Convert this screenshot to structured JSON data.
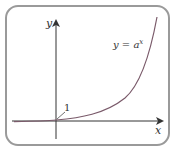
{
  "diagram": {
    "y_axis_label": "y",
    "x_axis_label": "x",
    "curve_label_base": "y = a",
    "curve_label_exp": "x",
    "intercept_label": "1",
    "colors": {
      "frame": "#9a9a9a",
      "axes": "#333333",
      "curve": "#7a5a6a"
    }
  }
}
